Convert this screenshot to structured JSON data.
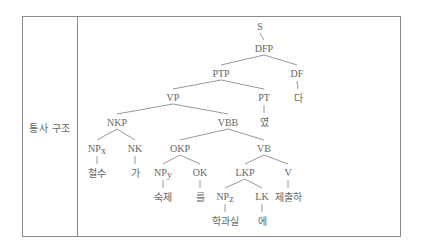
{
  "table": {
    "row_label": "통사 구조"
  },
  "tree": {
    "nodes": [
      {
        "id": "S",
        "label": "S",
        "kind": "cat"
      },
      {
        "id": "DFP",
        "label": "DFP",
        "kind": "cat"
      },
      {
        "id": "PTP",
        "label": "PTP",
        "kind": "cat"
      },
      {
        "id": "DF",
        "label": "DF",
        "kind": "cat"
      },
      {
        "id": "da",
        "label": "다",
        "kind": "word"
      },
      {
        "id": "VP",
        "label": "VP",
        "kind": "cat"
      },
      {
        "id": "PT",
        "label": "PT",
        "kind": "cat"
      },
      {
        "id": "yeot",
        "label": "였",
        "kind": "word"
      },
      {
        "id": "NKP",
        "label": "NKP",
        "kind": "cat"
      },
      {
        "id": "VBB",
        "label": "VBB",
        "kind": "cat"
      },
      {
        "id": "NPx",
        "label": "NP",
        "sub": "x",
        "kind": "cat"
      },
      {
        "id": "NK",
        "label": "NK",
        "kind": "cat"
      },
      {
        "id": "cheolsu",
        "label": "철수",
        "kind": "word"
      },
      {
        "id": "ga",
        "label": "가",
        "kind": "word"
      },
      {
        "id": "OKP",
        "label": "OKP",
        "kind": "cat"
      },
      {
        "id": "VB",
        "label": "VB",
        "kind": "cat"
      },
      {
        "id": "NPy",
        "label": "NP",
        "sub": "y",
        "kind": "cat"
      },
      {
        "id": "OK",
        "label": "OK",
        "kind": "cat"
      },
      {
        "id": "sukje",
        "label": "숙제",
        "kind": "word"
      },
      {
        "id": "reul",
        "label": "를",
        "kind": "word"
      },
      {
        "id": "LKP",
        "label": "LKP",
        "kind": "cat"
      },
      {
        "id": "V",
        "label": "V",
        "kind": "cat"
      },
      {
        "id": "NPz",
        "label": "NP",
        "sub": "z",
        "kind": "cat"
      },
      {
        "id": "LK",
        "label": "LK",
        "kind": "cat"
      },
      {
        "id": "jechulha",
        "label": "제출하",
        "kind": "word"
      },
      {
        "id": "hakgwasil",
        "label": "학과실",
        "kind": "word"
      },
      {
        "id": "e",
        "label": "에",
        "kind": "word"
      }
    ],
    "edges": [
      [
        "S",
        "DFP"
      ],
      [
        "DFP",
        "PTP"
      ],
      [
        "DFP",
        "DF"
      ],
      [
        "DF",
        "da"
      ],
      [
        "PTP",
        "VP"
      ],
      [
        "PTP",
        "PT"
      ],
      [
        "PT",
        "yeot"
      ],
      [
        "VP",
        "NKP"
      ],
      [
        "VP",
        "VBB"
      ],
      [
        "NKP",
        "NPx"
      ],
      [
        "NKP",
        "NK"
      ],
      [
        "NPx",
        "cheolsu"
      ],
      [
        "NK",
        "ga"
      ],
      [
        "VBB",
        "OKP"
      ],
      [
        "VBB",
        "VB"
      ],
      [
        "OKP",
        "NPy"
      ],
      [
        "OKP",
        "OK"
      ],
      [
        "NPy",
        "sukje"
      ],
      [
        "OK",
        "reul"
      ],
      [
        "VB",
        "LKP"
      ],
      [
        "VB",
        "V"
      ],
      [
        "V",
        "jechulha"
      ],
      [
        "LKP",
        "NPz"
      ],
      [
        "LKP",
        "LK"
      ],
      [
        "NPz",
        "hakgwasil"
      ],
      [
        "LK",
        "e"
      ]
    ]
  }
}
